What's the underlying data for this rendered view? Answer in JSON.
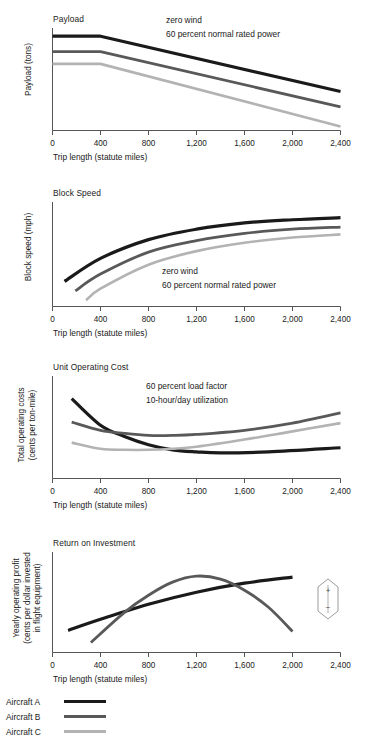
{
  "figure": {
    "x_axis_label": "Trip length (statute miles)",
    "x_ticks": [
      "0",
      "400",
      "800",
      "1,200",
      "1,600",
      "2,000",
      "2,400"
    ]
  },
  "legend": {
    "items": [
      {
        "label": "Aircraft A",
        "color": "#1a1a1a"
      },
      {
        "label": "Aircraft B",
        "color": "#595959"
      },
      {
        "label": "Aircraft C",
        "color": "#b3b3b3"
      }
    ]
  },
  "indicator": {
    "plus": "+",
    "minus": "−"
  },
  "panels": [
    {
      "title": "Payload",
      "ylabel": "Payload (tons)",
      "note_lines": [
        "zero wind",
        "60 percent normal rated power"
      ]
    },
    {
      "title": "Block Speed",
      "ylabel": "Block speed (mph)",
      "note_lines": [
        "zero wind",
        "60 percent normal rated power"
      ]
    },
    {
      "title": "Unit Operating Cost",
      "ylabel_lines": [
        "Total operating costs",
        "(cents per ton-mile)"
      ],
      "note_lines": [
        "60 percent load factor",
        "10-hour/day utilization"
      ]
    },
    {
      "title": "Return on Investment",
      "ylabel_lines": [
        "Yearly operating profit",
        "(cents per dollar invested",
        "in flight equipment)"
      ],
      "note_lines": []
    }
  ],
  "chart_data": [
    {
      "type": "line",
      "title": "Payload",
      "xlabel": "Trip length (statute miles)",
      "ylabel": "Payload (tons)",
      "xlim": [
        0,
        2400
      ],
      "ylim": [
        0,
        100
      ],
      "xticks": [
        0,
        400,
        800,
        1200,
        1600,
        2000,
        2400
      ],
      "grid": false,
      "legend": "external-bottom",
      "annotations": [
        "zero wind",
        "60 percent normal rated power"
      ],
      "series": [
        {
          "name": "Aircraft A",
          "color": "#1a1a1a",
          "x": [
            0,
            400,
            2400
          ],
          "y": [
            92,
            92,
            38
          ]
        },
        {
          "name": "Aircraft B",
          "color": "#595959",
          "x": [
            0,
            400,
            2400
          ],
          "y": [
            77,
            77,
            23
          ]
        },
        {
          "name": "Aircraft C",
          "color": "#b3b3b3",
          "x": [
            0,
            400,
            2400
          ],
          "y": [
            65,
            65,
            4
          ]
        }
      ]
    },
    {
      "type": "line",
      "title": "Block Speed",
      "xlabel": "Trip length (statute miles)",
      "ylabel": "Block speed (mph)",
      "xlim": [
        0,
        2400
      ],
      "ylim": [
        0,
        100
      ],
      "xticks": [
        0,
        400,
        800,
        1200,
        1600,
        2000,
        2400
      ],
      "grid": false,
      "legend": "external-bottom",
      "annotations": [
        "zero wind",
        "60 percent normal rated power"
      ],
      "series": [
        {
          "name": "Aircraft A",
          "color": "#1a1a1a",
          "x": [
            100,
            400,
            800,
            1200,
            1600,
            2000,
            2400
          ],
          "y": [
            24,
            46,
            64,
            74,
            80,
            83,
            85
          ]
        },
        {
          "name": "Aircraft B",
          "color": "#595959",
          "x": [
            190,
            400,
            800,
            1200,
            1600,
            2000,
            2400
          ],
          "y": [
            15,
            31,
            52,
            63,
            70,
            74,
            76
          ]
        },
        {
          "name": "Aircraft C",
          "color": "#b3b3b3",
          "x": [
            280,
            400,
            800,
            1200,
            1600,
            2000,
            2400
          ],
          "y": [
            6,
            17,
            40,
            53,
            61,
            66,
            69
          ]
        }
      ]
    },
    {
      "type": "line",
      "title": "Unit Operating Cost",
      "xlabel": "Trip length (statute miles)",
      "ylabel": "Total operating costs (cents per ton-mile)",
      "xlim": [
        0,
        2400
      ],
      "ylim": [
        0,
        100
      ],
      "xticks": [
        0,
        400,
        800,
        1200,
        1600,
        2000,
        2400
      ],
      "grid": false,
      "legend": "external-bottom",
      "annotations": [
        "60 percent load factor",
        "10-hour/day utilization"
      ],
      "series": [
        {
          "name": "Aircraft A",
          "color": "#1a1a1a",
          "x": [
            160,
            400,
            600,
            800,
            1000,
            1200,
            1400,
            1800,
            2400
          ],
          "y": [
            78,
            52,
            41,
            33,
            28,
            26,
            25,
            26,
            30
          ]
        },
        {
          "name": "Aircraft B",
          "color": "#595959",
          "x": [
            160,
            400,
            600,
            800,
            1000,
            1200,
            1600,
            2000,
            2400
          ],
          "y": [
            55,
            47,
            44,
            42,
            42,
            43,
            47,
            54,
            64
          ]
        },
        {
          "name": "Aircraft C",
          "color": "#b3b3b3",
          "x": [
            160,
            400,
            600,
            800,
            1000,
            1200,
            1600,
            2000,
            2400
          ],
          "y": [
            35,
            29,
            28,
            28,
            29,
            31,
            38,
            46,
            54
          ]
        }
      ]
    },
    {
      "type": "line",
      "title": "Return on Investment",
      "xlabel": "Trip length (statute miles)",
      "ylabel": "Yearly operating profit (cents per dollar invested in flight equipment)",
      "xlim": [
        0,
        2400
      ],
      "ylim": [
        0,
        100
      ],
      "xticks": [
        0,
        400,
        800,
        1200,
        1600,
        2000,
        2400
      ],
      "grid": false,
      "legend": "external-bottom",
      "annotations": [],
      "series": [
        {
          "name": "Aircraft A",
          "color": "#1a1a1a",
          "x": [
            130,
            400,
            800,
            1200,
            1600,
            2000
          ],
          "y": [
            22,
            33,
            48,
            60,
            69,
            75
          ]
        },
        {
          "name": "Aircraft B",
          "color": "#595959",
          "x": [
            320,
            600,
            800,
            1000,
            1200,
            1400,
            1600,
            1800,
            2000
          ],
          "y": [
            10,
            40,
            57,
            70,
            76,
            73,
            62,
            45,
            21
          ]
        }
      ]
    }
  ]
}
